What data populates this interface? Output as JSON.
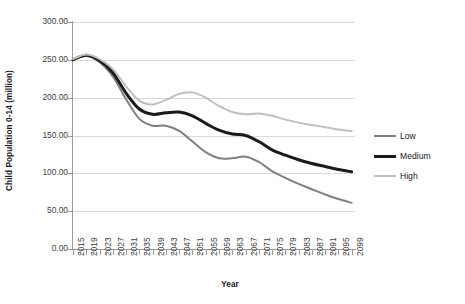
{
  "chart_data": {
    "type": "line",
    "title": "",
    "xlabel": "Year",
    "ylabel": "Child Population 0-14 (million)",
    "xlim": [
      2015,
      2100
    ],
    "ylim": [
      0,
      300
    ],
    "grid": true,
    "legend_position": "right",
    "y_ticks": [
      "0.00",
      "50.00",
      "100.00",
      "150.00",
      "200.00",
      "250.00",
      "300.00"
    ],
    "y_tick_values": [
      0,
      50,
      100,
      150,
      200,
      250,
      300
    ],
    "x_ticks": [
      "2015",
      "2019",
      "2023",
      "2027",
      "2031",
      "2035",
      "2039",
      "2043",
      "2047",
      "2051",
      "2055",
      "2059",
      "2063",
      "2067",
      "2071",
      "2075",
      "2079",
      "2083",
      "2087",
      "2091",
      "2095",
      "2099"
    ],
    "x": [
      2015,
      2019,
      2023,
      2027,
      2031,
      2035,
      2039,
      2043,
      2047,
      2051,
      2055,
      2059,
      2063,
      2067,
      2071,
      2075,
      2079,
      2083,
      2087,
      2091,
      2095,
      2099
    ],
    "series": [
      {
        "name": "Low",
        "color": "#808080",
        "width": 2.0,
        "values": [
          250,
          255,
          247,
          228,
          198,
          172,
          163,
          163,
          156,
          142,
          128,
          120,
          120,
          122,
          115,
          103,
          94,
          86,
          79,
          72,
          66,
          61
        ]
      },
      {
        "name": "Medium",
        "color": "#1a1a1a",
        "width": 3.0,
        "values": [
          250,
          256,
          249,
          233,
          206,
          185,
          178,
          180,
          181,
          176,
          166,
          157,
          152,
          150,
          142,
          131,
          124,
          118,
          113,
          109,
          105,
          102
        ]
      },
      {
        "name": "High",
        "color": "#bfbfbf",
        "width": 2.0,
        "values": [
          251,
          257,
          251,
          238,
          215,
          196,
          191,
          197,
          205,
          207,
          200,
          189,
          181,
          178,
          179,
          176,
          171,
          167,
          164,
          161,
          158,
          156
        ]
      }
    ],
    "legend": [
      {
        "label": "Low",
        "color": "#808080",
        "width": 2.0
      },
      {
        "label": "Medium",
        "color": "#1a1a1a",
        "width": 3.0
      },
      {
        "label": "High",
        "color": "#bfbfbf",
        "width": 2.0
      }
    ]
  }
}
